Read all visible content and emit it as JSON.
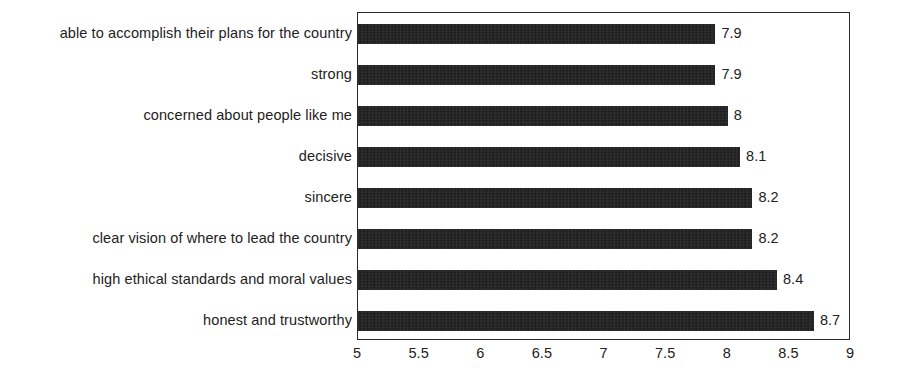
{
  "chart_data": {
    "type": "bar",
    "orientation": "horizontal",
    "title": "",
    "subtitle": "",
    "xlabel": "",
    "ylabel": "",
    "xlim": [
      5,
      9
    ],
    "ylim": null,
    "grid": false,
    "legend": null,
    "legend_position": "none",
    "bar_color": "#171717",
    "categories": [
      "able to accomplish their plans for the country",
      "strong",
      "concerned about people like me",
      "decisive",
      "sincere",
      "clear vision of where to lead the country",
      "high ethical standards and moral values",
      "honest and trustworthy"
    ],
    "values": [
      7.9,
      7.9,
      8,
      8.1,
      8.2,
      8.2,
      8.4,
      8.7
    ],
    "value_labels": [
      "7.9",
      "7.9",
      "8",
      "8.1",
      "8.2",
      "8.2",
      "8.4",
      "8.7"
    ],
    "xticks": [
      5,
      5.5,
      6,
      6.5,
      7,
      7.5,
      8,
      8.5,
      9
    ],
    "xtick_labels": [
      "5",
      "5.5",
      "6",
      "6.5",
      "7",
      "7.5",
      "8",
      "8.5",
      "9"
    ]
  }
}
